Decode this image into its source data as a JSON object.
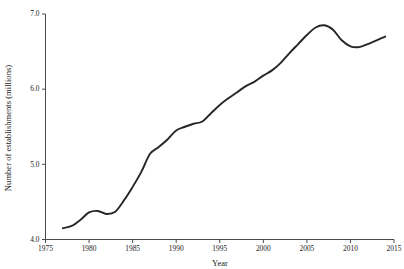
{
  "chart_data": {
    "type": "line",
    "title": "",
    "xlabel": "Year",
    "ylabel": "Number of establishments (millions)",
    "xlim": [
      1975,
      2015
    ],
    "ylim": [
      4.0,
      7.0
    ],
    "xticks": [
      1975,
      1980,
      1985,
      1990,
      1995,
      2000,
      2005,
      2010,
      2015
    ],
    "xtick_labels": [
      "1975",
      "1980",
      "1985",
      "1990",
      "1995",
      "2000",
      "2005",
      "2010",
      "2015"
    ],
    "yticks": [
      4.0,
      5.0,
      6.0,
      7.0
    ],
    "ytick_labels": [
      "4.0",
      "5.0",
      "6.0",
      "7.0"
    ],
    "grid": false,
    "legend": false,
    "line_color": "#262626",
    "series": [
      {
        "name": "Number of establishments",
        "x": [
          1977,
          1978,
          1979,
          1980,
          1981,
          1982,
          1983,
          1984,
          1985,
          1986,
          1987,
          1988,
          1989,
          1990,
          1991,
          1992,
          1993,
          1994,
          1995,
          1996,
          1997,
          1998,
          1999,
          2000,
          2001,
          2002,
          2003,
          2004,
          2005,
          2006,
          2007,
          2008,
          2009,
          2010,
          2011,
          2012,
          2013,
          2014
        ],
        "values": [
          4.15,
          4.18,
          4.26,
          4.36,
          4.38,
          4.34,
          4.37,
          4.52,
          4.7,
          4.9,
          5.14,
          5.23,
          5.33,
          5.45,
          5.5,
          5.54,
          5.57,
          5.68,
          5.79,
          5.88,
          5.96,
          6.04,
          6.1,
          6.18,
          6.25,
          6.35,
          6.48,
          6.6,
          6.72,
          6.82,
          6.85,
          6.79,
          6.65,
          6.57,
          6.56,
          6.6,
          6.65,
          6.7
        ]
      }
    ]
  },
  "axis_titles": {
    "x": "Year",
    "y": "Number of establishments (millions)"
  }
}
